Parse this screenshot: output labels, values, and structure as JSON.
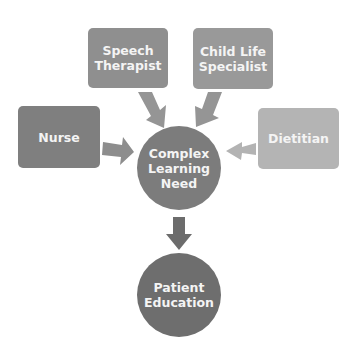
{
  "diagram": {
    "nodes": {
      "speech_therapist": {
        "label_line1": "Speech",
        "label_line2": "Therapist",
        "color": "#8f8f8f"
      },
      "child_life": {
        "label_line1": "Child Life",
        "label_line2": "Specialist",
        "color": "#999999"
      },
      "nurse": {
        "label": "Nurse",
        "color": "#7f7f7f"
      },
      "dietitian": {
        "label": "Dietitian",
        "color": "#b4b4b4"
      },
      "complex": {
        "label_line1": "Complex",
        "label_line2": "Learning",
        "label_line3": "Need",
        "color": "#7c7c7c"
      },
      "patient": {
        "label_line1": "Patient",
        "label_line2": "Education",
        "color": "#6e6e6e"
      }
    },
    "arrows": [
      {
        "from": "Speech Therapist",
        "to": "Complex Learning Need",
        "color": "#909090"
      },
      {
        "from": "Child Life Specialist",
        "to": "Complex Learning Need",
        "color": "#909090"
      },
      {
        "from": "Nurse",
        "to": "Complex Learning Need",
        "color": "#8a8a8a"
      },
      {
        "from": "Dietitian",
        "to": "Complex Learning Need",
        "color": "#b0b0b0"
      },
      {
        "from": "Complex Learning Need",
        "to": "Patient Education",
        "color": "#6a6a6a"
      }
    ]
  }
}
